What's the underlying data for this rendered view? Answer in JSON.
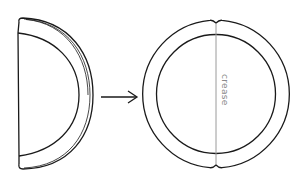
{
  "diagram": {
    "stroke_color": "#1a1a1a",
    "crease_color": "#9a9a9a",
    "left_shape": {
      "kind": "folded-half-ring"
    },
    "arrow": {
      "direction": "right"
    },
    "right_shape": {
      "kind": "ring",
      "crease": {
        "label": "crease",
        "orientation": "vertical"
      }
    }
  }
}
